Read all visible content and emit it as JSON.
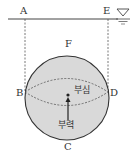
{
  "diagram": {
    "type": "buoyancy-sphere",
    "points": {
      "A": "A",
      "E": "E",
      "F": "F",
      "B": "B",
      "D": "D",
      "C": "C"
    },
    "labels": {
      "center_of_buoyancy": "부심",
      "buoyancy": "부력"
    },
    "icons": [
      "water-surface-icon"
    ],
    "colors": {
      "sphere_fill": "#d9d9d9",
      "stroke": "#333333",
      "background": "#ffffff"
    }
  }
}
